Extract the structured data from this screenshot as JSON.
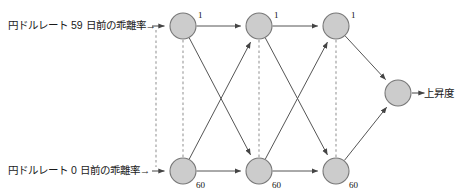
{
  "figure": {
    "type": "neural-network-diagram",
    "background_color": "#ffffff",
    "node_fill_color": "#cccccc",
    "node_stroke_color": "#777777",
    "edge_color": "#555555",
    "dashed_color": "#999999"
  },
  "inputs": [
    {
      "id": "input-top",
      "label": "円ドルレート 59 日前の乖離率",
      "arrow": "→",
      "x": 8,
      "y": 20
    },
    {
      "id": "input-bottom",
      "label": "円ドルレート 0 日前の乖離率",
      "arrow": "→",
      "x": 8,
      "y": 165
    }
  ],
  "output": {
    "id": "output",
    "label": "上昇度",
    "arrow": "→",
    "x": 424,
    "y": 88
  },
  "nodes": [
    {
      "id": "t1",
      "row": "top",
      "col": 1,
      "cx": 183,
      "cy": 26,
      "r": 13,
      "label": "1",
      "label_x": 198,
      "label_y": 11
    },
    {
      "id": "t2",
      "row": "top",
      "col": 2,
      "cx": 259,
      "cy": 26,
      "r": 13,
      "label": "1",
      "label_x": 274,
      "label_y": 11
    },
    {
      "id": "t3",
      "row": "top",
      "col": 3,
      "cx": 336,
      "cy": 26,
      "r": 13,
      "label": "1",
      "label_x": 351,
      "label_y": 11
    },
    {
      "id": "b1",
      "row": "bottom",
      "col": 1,
      "cx": 183,
      "cy": 171,
      "r": 13,
      "label": "60",
      "label_x": 196,
      "label_y": 181
    },
    {
      "id": "b2",
      "row": "bottom",
      "col": 2,
      "cx": 259,
      "cy": 171,
      "r": 13,
      "label": "60",
      "label_x": 272,
      "label_y": 181
    },
    {
      "id": "b3",
      "row": "bottom",
      "col": 3,
      "cx": 336,
      "cy": 171,
      "r": 13,
      "label": "60",
      "label_x": 349,
      "label_y": 181
    },
    {
      "id": "out",
      "row": "output",
      "col": 4,
      "cx": 398,
      "cy": 93,
      "r": 13,
      "label": "",
      "label_x": 0,
      "label_y": 0
    }
  ],
  "edges": [
    {
      "from": "t1",
      "to": "t2",
      "style": "solid"
    },
    {
      "from": "t2",
      "to": "t3",
      "style": "solid"
    },
    {
      "from": "b1",
      "to": "b2",
      "style": "solid"
    },
    {
      "from": "b2",
      "to": "b3",
      "style": "solid"
    },
    {
      "from": "t1",
      "to": "b2",
      "style": "solid"
    },
    {
      "from": "b1",
      "to": "t2",
      "style": "solid"
    },
    {
      "from": "t2",
      "to": "b3",
      "style": "solid"
    },
    {
      "from": "b2",
      "to": "t3",
      "style": "solid"
    },
    {
      "from": "t3",
      "to": "out",
      "style": "solid"
    },
    {
      "from": "b3",
      "to": "out",
      "style": "solid"
    }
  ],
  "dashed_connectors": [
    {
      "id": "dash-input-top",
      "x1": 156,
      "y1": 30,
      "x2": 156,
      "y2": 167
    },
    {
      "id": "dash-col-1",
      "x1": 183,
      "y1": 40,
      "x2": 183,
      "y2": 157
    },
    {
      "id": "dash-col-2",
      "x1": 259,
      "y1": 40,
      "x2": 259,
      "y2": 157
    },
    {
      "id": "dash-col-3",
      "x1": 336,
      "y1": 40,
      "x2": 336,
      "y2": 157
    }
  ],
  "input_arrows": [
    {
      "id": "arrow-in-top",
      "x1": 152,
      "y1": 26,
      "x2": 168,
      "y2": 26
    },
    {
      "id": "arrow-in-bottom",
      "x1": 152,
      "y1": 171,
      "x2": 168,
      "y2": 171
    }
  ],
  "output_arrow": {
    "id": "arrow-out",
    "x1": 412,
    "y1": 93,
    "x2": 428,
    "y2": 93
  }
}
